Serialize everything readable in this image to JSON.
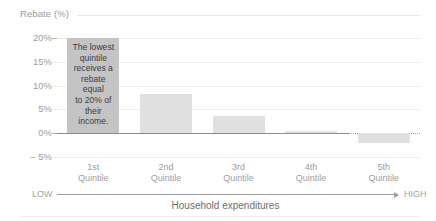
{
  "chart_data": {
    "type": "bar",
    "title": "",
    "subtitle": "",
    "ylabel": "Rebate (%)",
    "xlabel": "Household expenditures",
    "categories": [
      "1st\nQuintile",
      "2nd\nQuintile",
      "3rd\nQuintile",
      "4th\nQuintile",
      "5th\nQuintile"
    ],
    "category_lines": [
      [
        "1st",
        "Quintile"
      ],
      [
        "2nd",
        "Quintile"
      ],
      [
        "3rd",
        "Quintile"
      ],
      [
        "4th",
        "Quintile"
      ],
      [
        "5th",
        "Quintile"
      ]
    ],
    "values": [
      20,
      8.3,
      3.7,
      0.5,
      -2
    ],
    "ylim": [
      -5,
      20
    ],
    "yticks": [
      20,
      15,
      10,
      5,
      0,
      -5
    ],
    "ytick_labels": [
      "20%",
      "15%",
      "10%",
      "5%",
      "0%",
      "– 5%"
    ],
    "grid": true,
    "legend": "none",
    "bar_colors": [
      "#c4c4c4",
      "#e0e0e0",
      "#e0e0e0",
      "#e0e0e0",
      "#e0e0e0"
    ],
    "highlight_index": 0,
    "annotations": [
      {
        "target_category": "1st Quintile",
        "text": "The lowest quintile receives a rebate equal to 20% of their income.",
        "lines": [
          "The lowest",
          "quintile",
          "receives a",
          "rebate equal",
          "to 20% of",
          "their income."
        ]
      }
    ],
    "axis_direction": {
      "low_label": "LOW",
      "high_label": "HIGH"
    }
  },
  "colors": {
    "zero_line": "#8c8c8c",
    "gridline": "#ececec",
    "tick_text": "#9d9d9d",
    "bar_highlight": "#c4c4c4",
    "bar_default": "#e0e0e0",
    "annotation_text": "#3d3d3d",
    "axis_title": "#6e6e6e"
  }
}
